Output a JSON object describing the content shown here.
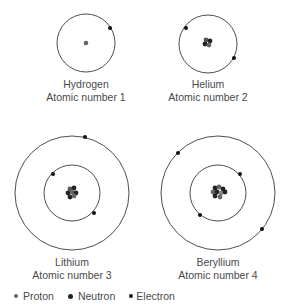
{
  "atoms": [
    {
      "name": "Hydrogen",
      "caption": "Atomic number 1",
      "protons": 1,
      "neutrons": 0,
      "electrons": 1,
      "shells": 1
    },
    {
      "name": "Helium",
      "caption": "Atomic number 2",
      "protons": 2,
      "neutrons": 2,
      "electrons": 2,
      "shells": 1
    },
    {
      "name": "Lithium",
      "caption": "Atomic number 3",
      "protons": 3,
      "neutrons": 4,
      "electrons": 3,
      "shells": 2
    },
    {
      "name": "Beryllium",
      "caption": "Atomic number 4",
      "protons": 4,
      "neutrons": 5,
      "electrons": 4,
      "shells": 2
    }
  ],
  "legend": {
    "proton": "Proton",
    "neutron": "Neutron",
    "electron": "Electron"
  },
  "colors": {
    "orbit": "#3a3a3a",
    "proton": "#666666",
    "neutron": "#222222",
    "electron": "#111111"
  }
}
